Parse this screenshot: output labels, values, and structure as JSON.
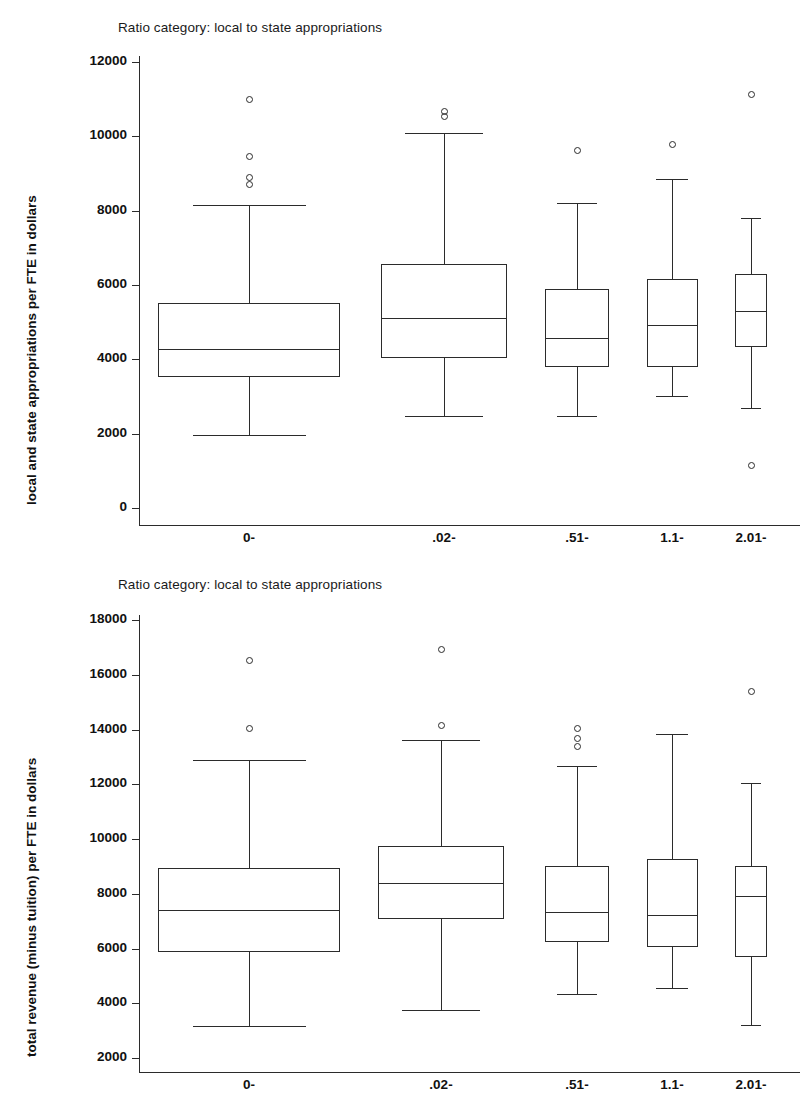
{
  "chart_data": [
    {
      "type": "box",
      "panel": "top",
      "title": "Ratio category: local to state appropriations",
      "xlabel": "",
      "ylabel": "local and state appropriations per FTE in dollars",
      "ylim": [
        0,
        12000
      ],
      "yticks": [
        12000,
        10000,
        8000,
        6000,
        4000,
        2000,
        0
      ],
      "ytick_labels": [
        "12000",
        "10000",
        "8000",
        "6000",
        "4000",
        "2000",
        "0"
      ],
      "grid": false,
      "legend": "none",
      "categories": [
        "0-",
        ".02-",
        ".51-",
        "1.1-",
        "2.01-"
      ],
      "boxes": [
        {
          "category": "0-",
          "whisker_low": 1960,
          "q1": 3530,
          "median": 4280,
          "q3": 5520,
          "whisker_high": 8150,
          "outliers": [
            11010,
            9480,
            8910,
            8720
          ]
        },
        {
          "category": ".02-",
          "whisker_low": 2480,
          "q1": 4040,
          "median": 5120,
          "q3": 6570,
          "whisker_high": 10090,
          "outliers": [
            10680,
            10560
          ]
        },
        {
          "category": ".51-",
          "whisker_low": 2480,
          "q1": 3800,
          "median": 4580,
          "q3": 5900,
          "whisker_high": 8210,
          "outliers": [
            9640
          ]
        },
        {
          "category": "1.1-",
          "whisker_low": 3020,
          "q1": 3800,
          "median": 4920,
          "q3": 6150,
          "whisker_high": 8860,
          "outliers": [
            9800
          ]
        },
        {
          "category": "2.01-",
          "whisker_low": 2690,
          "q1": 4330,
          "median": 5310,
          "q3": 6300,
          "whisker_high": 7790,
          "outliers": [
            11150,
            1160
          ]
        }
      ]
    },
    {
      "type": "box",
      "panel": "bottom",
      "title": "Ratio category: local to state appropriations",
      "xlabel": "",
      "ylabel": "total revenue (minus tuition) per FTE in dollars",
      "ylim": [
        2000,
        18000
      ],
      "yticks": [
        18000,
        16000,
        14000,
        12000,
        10000,
        8000,
        6000,
        4000,
        2000
      ],
      "ytick_labels": [
        "18000",
        "16000",
        "14000",
        "12000",
        "10000",
        "8000",
        "6000",
        "4000",
        "2000"
      ],
      "grid": false,
      "legend": "none",
      "categories": [
        "0-",
        ".02-",
        ".51-",
        "1.1-",
        "2.01-"
      ],
      "boxes": [
        {
          "category": "0-",
          "whisker_low": 3180,
          "q1": 5880,
          "median": 7400,
          "q3": 8950,
          "whisker_high": 12880,
          "outliers": [
            16540,
            14050
          ]
        },
        {
          "category": ".02-",
          "whisker_low": 3750,
          "q1": 7080,
          "median": 8380,
          "q3": 9760,
          "whisker_high": 13600,
          "outliers": [
            16940,
            14180
          ]
        },
        {
          "category": ".51-",
          "whisker_low": 4320,
          "q1": 6240,
          "median": 7330,
          "q3": 9000,
          "whisker_high": 12680,
          "outliers": [
            14050,
            13700,
            13380
          ]
        },
        {
          "category": "1.1-",
          "whisker_low": 4540,
          "q1": 6060,
          "median": 7240,
          "q3": 9270,
          "whisker_high": 13820,
          "outliers": []
        },
        {
          "category": "2.01-",
          "whisker_low": 3200,
          "q1": 5700,
          "median": 7930,
          "q3": 9000,
          "whisker_high": 12050,
          "outliers": [
            15400
          ]
        }
      ]
    }
  ],
  "colors": {
    "ink": "#2b2b2b",
    "text": "#111111",
    "background": "#ffffff"
  }
}
